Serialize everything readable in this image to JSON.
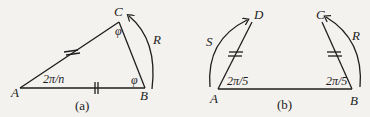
{
  "figure": {
    "panel_a": {
      "caption": "(a)",
      "vertices": {
        "A": "A",
        "B": "B",
        "C": "C"
      },
      "angle_A": "2π/n",
      "angle_B": "φ",
      "angle_C": "φ",
      "rotation_label": "R"
    },
    "panel_b": {
      "caption": "(b)",
      "vertices": {
        "A": "A",
        "B": "B",
        "C": "C",
        "D": "D"
      },
      "angle_A": "2π/5",
      "angle_B": "2π/5",
      "rotation_left_label": "S",
      "rotation_right_label": "R"
    }
  }
}
